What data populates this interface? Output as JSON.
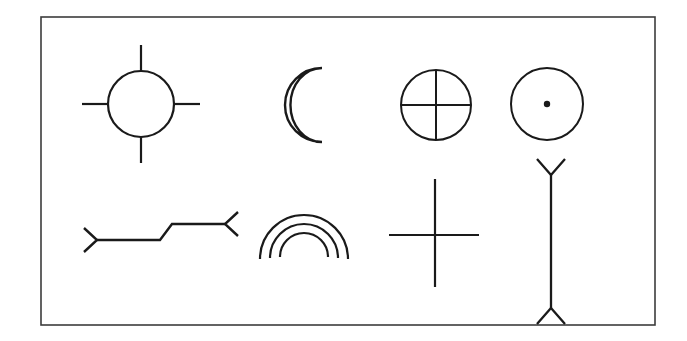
{
  "figure": {
    "background_color": "#ffffff",
    "ink_color": "#1a1a1a",
    "frame_color": "#3c3c3c",
    "title": "",
    "caption": "",
    "frame": {
      "x": 41,
      "y": 17,
      "width": 614,
      "height": 308
    },
    "rows": 2,
    "columns": 4,
    "symbols": [
      {
        "id": "symbol-1",
        "name": "circle-with-four-rays",
        "label": "",
        "row": 1,
        "column": 1,
        "center_x": 141,
        "center_y": 104,
        "radius": 33,
        "ray_length": 26,
        "stroke_width": 2.2
      },
      {
        "id": "symbol-2",
        "name": "crescent-moon",
        "label": "",
        "row": 1,
        "column": 2,
        "center_x": 303,
        "center_y": 105,
        "radius": 37,
        "inner_offset_x": 19,
        "inner_radius": 33,
        "stroke_width": 2.4
      },
      {
        "id": "symbol-3",
        "name": "quartered-circle-cross",
        "label": "",
        "row": 1,
        "column": 3,
        "center_x": 436,
        "center_y": 105,
        "radius": 35,
        "stroke_width": 2.0
      },
      {
        "id": "symbol-4",
        "name": "circle-with-center-dot",
        "label": "",
        "row": 1,
        "column": 4,
        "center_x": 547,
        "center_y": 104,
        "radius": 36,
        "dot_radius": 3.2,
        "stroke_width": 2.0
      },
      {
        "id": "symbol-5",
        "name": "double-headed-zigzag-arrow",
        "label": "",
        "row": 2,
        "column": 1,
        "stroke_width": 2.4,
        "points": [
          [
            97,
            240
          ],
          [
            160,
            240
          ],
          [
            172,
            224
          ],
          [
            225,
            224
          ]
        ],
        "left_head": [
          [
            84,
            228
          ],
          [
            97,
            240
          ],
          [
            84,
            252
          ]
        ],
        "right_head": [
          [
            238,
            212
          ],
          [
            225,
            224
          ],
          [
            238,
            236
          ]
        ]
      },
      {
        "id": "symbol-6",
        "name": "triple-concentric-rainbow-arcs",
        "label": "",
        "row": 2,
        "column": 2,
        "center_x": 304,
        "base_y": 259,
        "radii": [
          44,
          34,
          24
        ],
        "stroke_width": 2.2
      },
      {
        "id": "symbol-7",
        "name": "plus-cross",
        "label": "",
        "row": 2,
        "column": 3,
        "center_x": 435,
        "center_y": 235,
        "arm_up": 56,
        "arm_down": 52,
        "arm_left": 46,
        "arm_right": 44,
        "stroke_width": 2.2
      },
      {
        "id": "symbol-8",
        "name": "vertical-line-with-forked-ends",
        "label": "",
        "row": 2,
        "column": 4,
        "center_x": 551,
        "top_y": 175,
        "bottom_y": 308,
        "fork_spread": 14,
        "fork_depth": 16,
        "stroke_width": 2.3
      }
    ]
  }
}
